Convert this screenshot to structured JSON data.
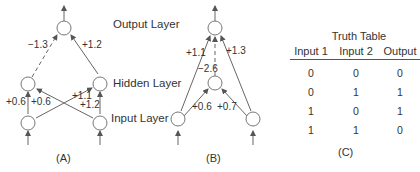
{
  "layer_labels": {
    "output": "Output Layer",
    "hidden": "Hidden Layer",
    "input": "Input Layer"
  },
  "network_a": {
    "caption": "(A)",
    "weights": {
      "hidden1_to_output": "−1.3",
      "hidden2_to_output": "+1.2",
      "input1_to_hidden1": "+0.6",
      "input2_to_hidden1": "+0.6",
      "input1_to_hidden2": "+1.1",
      "input2_to_hidden2": "+1.2"
    }
  },
  "network_b": {
    "caption": "(B)",
    "weights": {
      "input1_to_output": "+1.1",
      "input2_to_output": "+1.3",
      "hidden_to_output": "−2.6",
      "input1_to_hidden": "+0.6",
      "input2_to_hidden": "+0.7"
    }
  },
  "truth_table": {
    "title": "Truth Table",
    "caption": "(C)",
    "headers": [
      "Input 1",
      "Input 2",
      "Output"
    ],
    "rows": [
      [
        "0",
        "0",
        "0"
      ],
      [
        "0",
        "1",
        "1"
      ],
      [
        "1",
        "0",
        "1"
      ],
      [
        "1",
        "1",
        "0"
      ]
    ]
  }
}
